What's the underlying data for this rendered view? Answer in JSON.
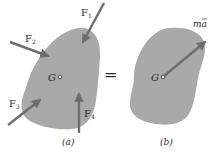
{
  "diagram": {
    "panel_a": {
      "caption": "(a)",
      "center_label": "G",
      "forces": [
        {
          "name": "F",
          "sub": "1"
        },
        {
          "name": "F",
          "sub": "2"
        },
        {
          "name": "F",
          "sub": "3"
        },
        {
          "name": "F",
          "sub": "4"
        }
      ]
    },
    "equals": "=",
    "panel_b": {
      "caption": "(b)",
      "center_label": "G",
      "resultant": {
        "m": "m",
        "a": "a",
        "bar": "‾"
      }
    },
    "colors": {
      "body_fill": "#a9a9a9",
      "arrow": "#6e6e6e",
      "text": "#2a2a2a"
    }
  }
}
